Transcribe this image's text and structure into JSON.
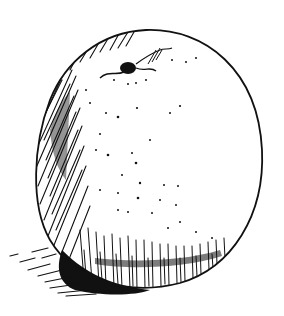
{
  "image": {
    "subject": "Pen-and-ink illustration of an orange",
    "style": "black ink hatching on white",
    "colors": {
      "ink": "#111111",
      "paper": "#ffffff"
    },
    "elements": [
      "orange-body",
      "stem-end",
      "hatching-shade",
      "peel-dots",
      "cast-shadow"
    ]
  }
}
